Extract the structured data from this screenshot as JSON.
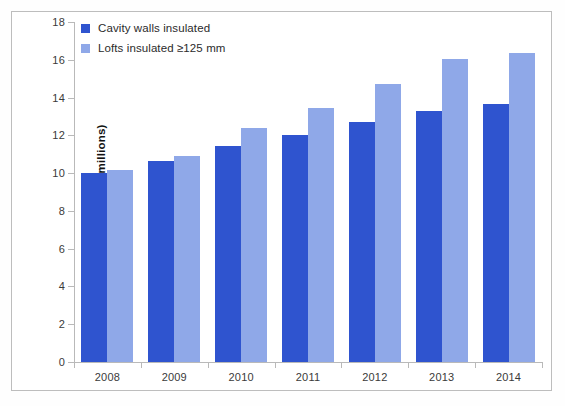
{
  "chart_data": {
    "type": "bar",
    "title": "",
    "subtitle": "",
    "xlabel": "",
    "ylabel": "Number of homes (millions)",
    "categories": [
      "2008",
      "2009",
      "2010",
      "2011",
      "2012",
      "2013",
      "2014"
    ],
    "series": [
      {
        "name": "Cavity walls insulated",
        "color": "#2f54cf",
        "values": [
          10.0,
          10.65,
          11.45,
          12.0,
          12.7,
          13.3,
          13.65
        ]
      },
      {
        "name": "Lofts insulated ≥125 mm",
        "color": "#8fa8e8",
        "values": [
          10.15,
          10.9,
          12.4,
          13.45,
          14.7,
          16.05,
          16.35
        ]
      }
    ],
    "ylim": [
      0,
      18
    ],
    "yticks": [
      0,
      2,
      4,
      6,
      8,
      10,
      12,
      14,
      16,
      18
    ],
    "ytick_labels": [
      "0",
      "2",
      "4",
      "6",
      "8",
      "10",
      "12",
      "14",
      "16",
      "18"
    ],
    "grid": false,
    "legend_position": "top-left",
    "axis_color": "#b9b9b9",
    "background": "#ffffff"
  }
}
